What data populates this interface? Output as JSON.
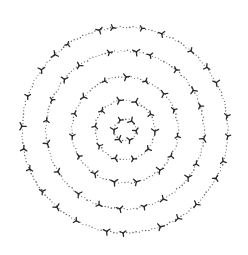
{
  "image": {
    "description": "Hand-drawn concentric dotted circles with small three-pronged tick marks",
    "background": "#ffffff",
    "ink_color": "#2a2a2a",
    "dot_color": "#6a6a6a",
    "center": [
      125,
      130
    ],
    "rings": [
      {
        "radius": 103,
        "marks": 26
      },
      {
        "radius": 79,
        "marks": 20
      },
      {
        "radius": 53,
        "marks": 15
      },
      {
        "radius": 30,
        "marks": 10
      },
      {
        "radius": 11,
        "marks": 6
      }
    ]
  }
}
